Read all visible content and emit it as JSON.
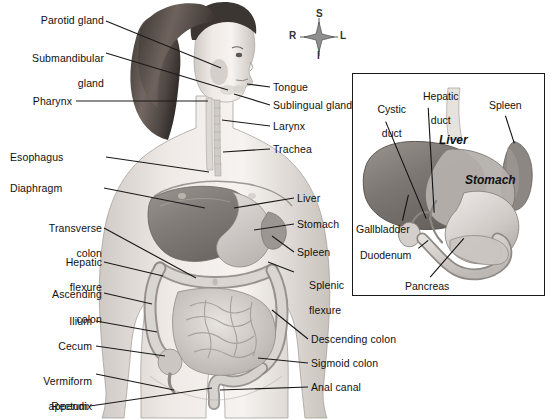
{
  "figure": {
    "background_color": "#ffffff",
    "text_color": "#111111",
    "leader_line_color": "#1a1a1a"
  },
  "orientation_compass": {
    "name": "anatomical-orientation-indicator",
    "superior": "S",
    "inferior": "I",
    "right": "R",
    "left": "L"
  },
  "main_figure": {
    "description": "Female body in anterior view with digestive organs",
    "labels_left": [
      {
        "text": "Parotid gland",
        "lines": [
          "Parotid gland"
        ],
        "x": 18,
        "y": 16,
        "w": 86
      },
      {
        "text": "Submandibular gland",
        "lines": [
          "Submandibular",
          "gland"
        ],
        "x": 18,
        "y": 42,
        "w": 86
      },
      {
        "text": "Pharynx",
        "lines": [
          "Pharynx"
        ],
        "x": 32,
        "y": 96,
        "w": 72
      },
      {
        "text": "Esophagus",
        "lines": [
          "Esophagus"
        ],
        "x": 12,
        "y": 152,
        "w": 92
      },
      {
        "text": "Diaphragm",
        "lines": [
          "Diaphragm"
        ],
        "x": 12,
        "y": 183,
        "w": 90
      },
      {
        "text": "Transverse colon",
        "lines": [
          "Transverse",
          "colon"
        ],
        "x": 12,
        "y": 211,
        "w": 90
      },
      {
        "text": "Hepatic flexure",
        "lines": [
          "Hepatic",
          "flexure"
        ],
        "x": 12,
        "y": 245,
        "w": 90
      },
      {
        "text": "Ascending colon",
        "lines": [
          "Ascending",
          "colon"
        ],
        "x": 12,
        "y": 277,
        "w": 90
      },
      {
        "text": "Ilium",
        "lines": [
          "Ilium"
        ],
        "x": 12,
        "y": 316,
        "w": 80
      },
      {
        "text": "Cecum",
        "lines": [
          "Cecum"
        ],
        "x": 12,
        "y": 341,
        "w": 80
      },
      {
        "text": "Vermiform appendix",
        "lines": [
          "Vermiform",
          "appendix"
        ],
        "x": 12,
        "y": 363,
        "w": 80
      },
      {
        "text": "Rectum",
        "lines": [
          "Rectum"
        ],
        "x": 24,
        "y": 402,
        "w": 68
      }
    ],
    "labels_right": [
      {
        "text": "Tongue",
        "lines": [
          "Tongue"
        ],
        "x": 272,
        "y": 82
      },
      {
        "text": "Sublingual gland",
        "lines": [
          "Sublingual gland"
        ],
        "x": 272,
        "y": 100
      },
      {
        "text": "Larynx",
        "lines": [
          "Larynx"
        ],
        "x": 272,
        "y": 121
      },
      {
        "text": "Trachea",
        "lines": [
          "Trachea"
        ],
        "x": 272,
        "y": 144
      },
      {
        "text": "Liver",
        "lines": [
          "Liver"
        ],
        "x": 296,
        "y": 193
      },
      {
        "text": "Stomach",
        "lines": [
          "Stomach"
        ],
        "x": 296,
        "y": 219
      },
      {
        "text": "Spleen",
        "lines": [
          "Spleen"
        ],
        "x": 296,
        "y": 247
      },
      {
        "text": "Splenic flexure",
        "lines": [
          "Splenic",
          "flexure"
        ],
        "x": 296,
        "y": 267
      },
      {
        "text": "Descending colon",
        "lines": [
          "Descending colon"
        ],
        "x": 310,
        "y": 334
      },
      {
        "text": "Sigmoid colon",
        "lines": [
          "Sigmoid colon"
        ],
        "x": 310,
        "y": 358
      },
      {
        "text": "Anal canal",
        "lines": [
          "Anal canal"
        ],
        "x": 310,
        "y": 382
      }
    ]
  },
  "inset_panel": {
    "description": "Close-up of liver, stomach, gallbladder, pancreas and duodenum",
    "organ_labels": [
      {
        "text": "Liver",
        "x": 90,
        "y": 66
      },
      {
        "text": "Stomach",
        "x": 118,
        "y": 106
      }
    ],
    "callout_labels": [
      {
        "text": "Cystic duct",
        "lines": [
          "Cystic",
          "duct"
        ],
        "x": 10,
        "y": 21,
        "align": "center"
      },
      {
        "text": "Hepatic duct",
        "lines": [
          "Hepatic",
          "duct"
        ],
        "x": 58,
        "y": 8,
        "align": "center"
      },
      {
        "text": "Spleen",
        "lines": [
          "Spleen"
        ],
        "x": 137,
        "y": 28,
        "align": "left"
      },
      {
        "text": "Gallbladder",
        "lines": [
          "Gallbladder"
        ],
        "x": 4,
        "y": 152,
        "align": "left"
      },
      {
        "text": "Duodenum",
        "lines": [
          "Duodenum"
        ],
        "x": 8,
        "y": 178,
        "align": "left"
      },
      {
        "text": "Pancreas",
        "lines": [
          "Pancreas"
        ],
        "x": 54,
        "y": 209,
        "align": "left"
      }
    ]
  }
}
